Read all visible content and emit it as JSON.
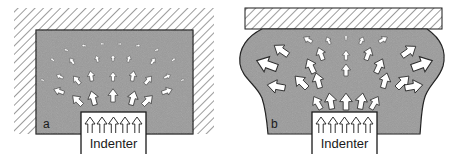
{
  "figure": {
    "colors": {
      "material": "#9a9a9a",
      "outline": "#1a1a1a",
      "hatch": "#3a3a3a",
      "arrow_fill": "#ffffff",
      "background": "#ffffff"
    },
    "panels": [
      {
        "id": "a",
        "label": "a",
        "indenter_label": "Indenter",
        "constraint": "fully confined (hatched walls on top and sides)",
        "description": "Confined material: small displacement vectors radiating from indenter"
      },
      {
        "id": "b",
        "label": "b",
        "indenter_label": "Indenter",
        "constraint": "hatched plate on top only, free sides",
        "description": "Unconfined sides: large displacement vectors, material bulges outward"
      }
    ]
  }
}
